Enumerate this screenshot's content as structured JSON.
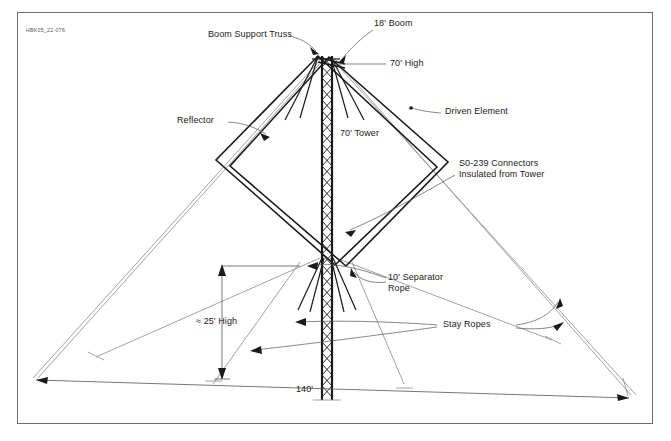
{
  "document": {
    "doc_id": "HBK05_22-076",
    "title": "Two-Element Quad Antenna on 70' Tower"
  },
  "labels": {
    "boom_support_truss": "Boom Support Truss",
    "boom": "18' Boom",
    "high_70": "70' High",
    "reflector": "Reflector",
    "driven_element": "Driven Element",
    "tower": "70' Tower",
    "connectors_line1": "S0-239 Connectors",
    "connectors_line2": "Insulated from Tower",
    "separator_line1": "10' Separator",
    "separator_line2": "Rope",
    "stay_ropes": "Stay Ropes",
    "height_25": "≈ 25' High",
    "span_140": "140'"
  },
  "dimensions": {
    "tower_height": "70'",
    "boom_length": "18'",
    "separator_rope": "10'",
    "stay_height": "≈ 25'",
    "base_span": "140'"
  },
  "colors": {
    "ink": "#1a1a1a",
    "frame": "#6e6e6e",
    "rope": "#8a8a8a",
    "leader": "#555555",
    "background": "#ffffff"
  }
}
